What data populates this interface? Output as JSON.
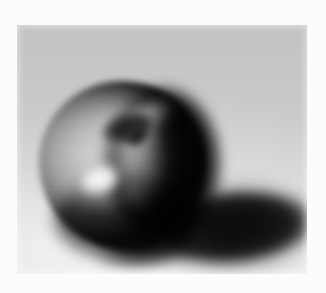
{
  "image": {
    "kind": "photograph",
    "medium": "black-and-white film print",
    "subject": "apple",
    "caption": "Soft-focus black-and-white photograph of a single apple resting on a pale surface, lit from the left, casting a long dark shadow to the right.",
    "orientation": "landscape",
    "canvas": {
      "width": 326,
      "height": 293
    },
    "border": {
      "name": "white print border",
      "color": "#fcfcfc",
      "left": 17,
      "top": 25,
      "right": 19,
      "bottom": 19
    },
    "photo_area": {
      "x": 17,
      "y": 25,
      "width": 290,
      "height": 249
    },
    "focus": "soft / blurred",
    "grain": "visible film grain",
    "palette": {
      "border_white": "#fcfcfc",
      "backdrop_top_gray": "#c3c3c3",
      "backdrop_bottom_light": "#efefef",
      "apple_lit_gray": "#cfcfcf",
      "apple_midtone": "#8a8a8a",
      "apple_shadow_side": "#141414",
      "stem_cavity_dark": "#171717",
      "specular_highlight": "#fbfbfb",
      "cast_shadow_core": "#0a0a0a"
    },
    "elements": [
      {
        "name": "backdrop",
        "label": "Studio backdrop",
        "description": "Vertical tonal sweep running from mid gray along the top to near-white along the bottom."
      },
      {
        "name": "apple",
        "label": "Apple",
        "description": "Rounded fruit occupying the left-centre of the frame; brightly lit on the left flank, falling into near-black on the right limb.",
        "bounds": {
          "x": 22,
          "y": 56,
          "width": 180,
          "height": 180
        }
      },
      {
        "name": "stem-cavity",
        "label": "Stem cavity",
        "description": "Dark crescent-shaped depression at the top of the apple where the stem sits.",
        "center": {
          "x": 112,
          "y": 105
        }
      },
      {
        "name": "specular-highlight",
        "label": "Specular highlight",
        "description": "Small bright blob of reflected light on the upper-left of the apple's skin.",
        "center": {
          "x": 75,
          "y": 154
        }
      },
      {
        "name": "cast-shadow",
        "label": "Cast shadow",
        "description": "Long, dark, blurred ellipse thrown to the right of the apple, tapering to a point near the right edge of the print.",
        "bounds": {
          "x": 135,
          "y": 163,
          "width": 172,
          "height": 78
        }
      },
      {
        "name": "contact-shadow",
        "label": "Contact shadow",
        "description": "Dense shadow where the apple meets the surface, directly under its base."
      }
    ]
  }
}
